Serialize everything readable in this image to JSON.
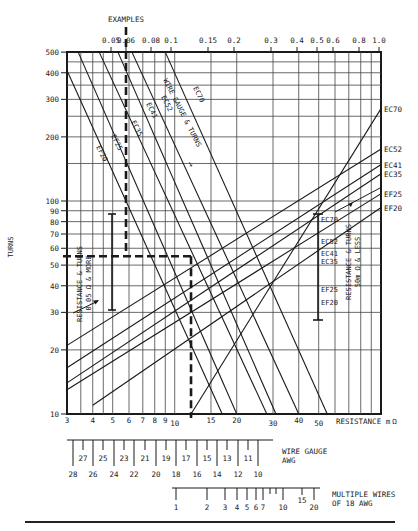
{
  "chart_data": {
    "type": "line",
    "title": "",
    "chart_kind": "nomograph (log-log)",
    "xscale": "log",
    "yscale": "log",
    "xlabel": "RESISTANCE mΩ",
    "ylabel": "TURNS",
    "top_axis_label": "EXAMPLES",
    "xlim": [
      3,
      100
    ],
    "ylim": [
      10,
      500
    ],
    "grid": true,
    "x_ticks_bottom": [
      3,
      4,
      5,
      6,
      7,
      8,
      9,
      10,
      15,
      20,
      30,
      40,
      50
    ],
    "x_ticks_bottom_labels": [
      "3",
      "4",
      "5",
      "6",
      "7",
      "8",
      "9",
      "10",
      "15",
      "20",
      "30",
      "40",
      "50"
    ],
    "x_ticks_top": [
      0.05,
      0.06,
      0.08,
      0.1,
      0.15,
      0.2,
      0.3,
      0.4,
      0.5,
      0.6,
      0.8,
      1.0
    ],
    "x_ticks_top_labels": [
      "0.05",
      "0.06",
      "0.08",
      "0.1",
      "0.15",
      "0.2",
      "0.3",
      "0.4",
      "0.5",
      "0.6",
      "0.8",
      "1.0"
    ],
    "y_ticks": [
      10,
      20,
      30,
      40,
      50,
      60,
      70,
      80,
      90,
      100,
      200,
      300,
      400,
      500
    ],
    "y_ticks_labels": [
      "10",
      "20",
      "30",
      "40",
      "50",
      "60",
      "70",
      "80",
      "90",
      "100",
      "200",
      "300",
      "400",
      "500"
    ],
    "series_wire_gauge_turns": {
      "label": "WIRE GAUGE & TURNS",
      "direction": "decreasing (falling left-to-right)",
      "lines": [
        {
          "name": "EF20",
          "points": [
            [
              3,
              410
            ],
            [
              17,
              10
            ]
          ]
        },
        {
          "name": "EF25",
          "points": [
            [
              3.4,
              500
            ],
            [
              20,
              10
            ]
          ]
        },
        {
          "name": "EC35",
          "points": [
            [
              4.3,
              500
            ],
            [
              28,
              10
            ]
          ]
        },
        {
          "name": "EC41",
          "points": [
            [
              5.3,
              500
            ],
            [
              31,
              10
            ]
          ]
        },
        {
          "name": "EC52",
          "points": [
            [
              6.2,
              500
            ],
            [
              40,
              10
            ]
          ]
        },
        {
          "name": "EC70",
          "points": [
            [
              9,
              500
            ],
            [
              55,
              10
            ]
          ]
        }
      ]
    },
    "series_resistance_turns": {
      "label": "RESISTANCE & TURNS",
      "direction": "increasing (rising left-to-right)",
      "lines": [
        {
          "name": "EC70",
          "points": [
            [
              12,
              10
            ],
            [
              100,
              270
            ]
          ]
        },
        {
          "name": "EC52",
          "points": [
            [
              3,
              21
            ],
            [
              100,
              175
            ]
          ]
        },
        {
          "name": "EC41",
          "points": [
            [
              3,
              16.5
            ],
            [
              100,
              148
            ]
          ]
        },
        {
          "name": "EC35",
          "points": [
            [
              3,
              14
            ],
            [
              100,
              134
            ]
          ]
        },
        {
          "name": "EF25",
          "points": [
            [
              3,
              13
            ],
            [
              100,
              108
            ]
          ]
        },
        {
          "name": "EF20",
          "points": [
            [
              4,
              11
            ],
            [
              100,
              93
            ]
          ]
        }
      ],
      "left_annotation": "RESISTANCE & TURNS 0.05 Ω & MORE",
      "right_annotation": "RESISTANCE & TURNS 50m Ω & LESS"
    },
    "example_path": {
      "description": "Dashed example: 0.06 top → down to 55 turns → across to ≈12 mΩ → down",
      "top_x_value": 0.06,
      "turns": 55,
      "resistance_mohm": 12
    },
    "auxiliary_scales": [
      {
        "name": "WIRE GAUGE AWG",
        "ticks_long": [
          28,
          26,
          24,
          22,
          20,
          18,
          16,
          14,
          12,
          10
        ],
        "ticks_short": [
          27,
          25,
          23,
          21,
          19,
          17,
          15,
          13,
          11
        ]
      },
      {
        "name": "MULTIPLE WIRES OF 18 AWG",
        "ticks_labeled": [
          1,
          2,
          3,
          4,
          5,
          6,
          7,
          10,
          15,
          20
        ],
        "ticks_unlabeled": [
          8,
          9
        ]
      }
    ]
  },
  "labels": {
    "examples": "EXAMPLES",
    "turns": "TURNS",
    "resistance": "RESISTANCE m",
    "ohm": "Ω",
    "wg_line1": "WIRE GAUGE & TURNS",
    "wg_arrow": "→",
    "rt_left_1": "RESISTANCE & TURNS",
    "rt_left_2": "0.05 Ω & MORE",
    "rt_right_1": "RESISTANCE & TURNS",
    "rt_right_2": "50m Ω & LESS",
    "awg_1": "WIRE GAUGE",
    "awg_2": "AWG",
    "mw_1": "MULTIPLE WIRES",
    "mw_2": "OF 18 AWG",
    "caption": ""
  },
  "colors": {
    "ink": "#1a1a1a",
    "grid": "#3a3a3a",
    "background": "#ffffff"
  }
}
